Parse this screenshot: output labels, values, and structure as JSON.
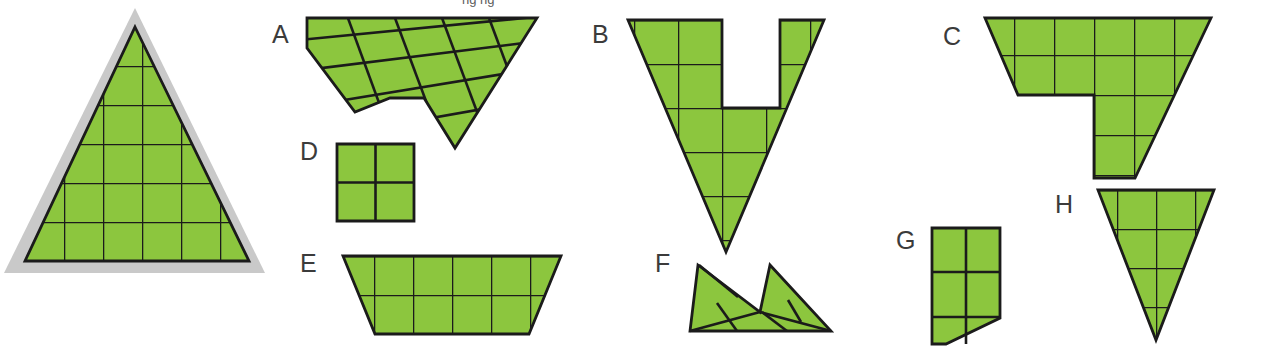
{
  "figure": {
    "background_color": "#ffffff",
    "shape_fill_color": "#8cc63e",
    "outline_color": "#1b1b1b",
    "halo_color": "#c9c9c9",
    "label_color": "#3b3b3b",
    "cropped_header_text": "ng ng"
  },
  "reference": {
    "name": "reference-triangle",
    "label": "",
    "description": "Equilateral-looking triangle filled green with a square grid, surrounded by a light gray halo outline",
    "halo_points": "135,8 265,273 4,273",
    "triangle_points": "135,27 249,261 25,261",
    "grid_cell_px": 39,
    "grid_rows": 6,
    "grid_columns": 6
  },
  "labels": [
    {
      "id": "A",
      "text": "A",
      "x": 272,
      "y": 43
    },
    {
      "id": "B",
      "text": "B",
      "x": 592,
      "y": 43
    },
    {
      "id": "C",
      "text": "C",
      "x": 943,
      "y": 45
    },
    {
      "id": "D",
      "text": "D",
      "x": 300,
      "y": 160
    },
    {
      "id": "E",
      "text": "E",
      "x": 300,
      "y": 272
    },
    {
      "id": "F",
      "text": "F",
      "x": 655,
      "y": 272
    },
    {
      "id": "G",
      "text": "G",
      "x": 896,
      "y": 249
    },
    {
      "id": "H",
      "text": "H",
      "x": 1055,
      "y": 213
    }
  ],
  "shapes": {
    "A": {
      "name": "shape-a",
      "label": "A",
      "description": "Sheared parallelogram strip of squares with a notch, right end tapers to a point",
      "outline": "307,18 537,18 455,148 424,98 390,98 355,112 307,48",
      "lines": [
        "322,36 536,18",
        "340,60 520,36",
        "355,85 500,60",
        "340,60 307,48",
        "322,36 307,18",
        "390,27 424,98",
        "437,22 470,118",
        "483,20 505,70",
        "355,112 390,98",
        "470,118 455,148",
        "505,70 500,60"
      ]
    },
    "B": {
      "name": "shape-b",
      "label": "B",
      "description": "V-shaped (inverted triangle with rectangular notch cut from top middle)",
      "outline": "628,20 722,20 722,108 780,108 780,20 824,20 726,252",
      "lines": []
    },
    "C": {
      "name": "shape-c",
      "label": "C",
      "description": "Wide trapezoid band with a descending tab on the lower right",
      "outline": "985,18 1211,18 1135,178 1094,178 1094,95 1018,95",
      "lines": []
    },
    "D": {
      "name": "shape-d",
      "label": "D",
      "description": "2 by 2 square of four unit squares",
      "outline": "337,144 414,144 414,221 337,221",
      "lines": [
        "375,144 375,221",
        "337,183 414,183"
      ]
    },
    "E": {
      "name": "shape-e",
      "label": "E",
      "description": "Wide isosceles trapezoid two cells tall and five cells wide",
      "outline": "343,256 561,256 529,334 375,334",
      "lines": []
    },
    "F": {
      "name": "shape-f",
      "label": "F",
      "description": "Low slanted band of triangles and parallelograms with a peak near the right",
      "outline": "698,265 760,312 770,265 831,331 690,331",
      "lines": []
    },
    "G": {
      "name": "shape-g",
      "label": "G",
      "description": "Two by two square block with lower-left corner trimmed diagonally",
      "outline": "932,228 1000,228 1000,318 946,344 932,344",
      "lines": [
        "966,228 966,344",
        "932,272 1000,272",
        "932,318 1000,318"
      ]
    },
    "H": {
      "name": "shape-h",
      "label": "H",
      "description": "Downward pointing triangle filled with a square grid",
      "outline": "1098,190 1214,190 1156,340",
      "lines": []
    }
  },
  "grid": {
    "cell_size_px": 39,
    "stroke_width_px": 2.6
  }
}
